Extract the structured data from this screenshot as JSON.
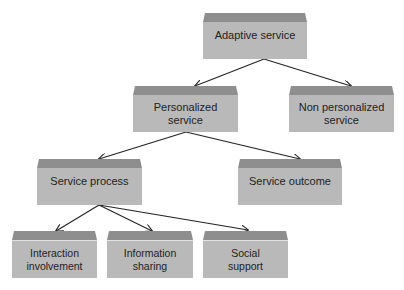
{
  "diagram": {
    "nodes": {
      "adaptive": {
        "label": "Adaptive service"
      },
      "personalized": {
        "label": "Personalized service"
      },
      "non_personalized": {
        "label": "Non personalized service"
      },
      "service_process": {
        "label": "Service process"
      },
      "service_outcome": {
        "label": "Service outcome"
      },
      "interaction": {
        "label": "Interaction involvement"
      },
      "information": {
        "label": "Information sharing"
      },
      "social": {
        "label": "Social support"
      }
    },
    "edges": [
      {
        "from": "Adaptive service",
        "to": "Personalized service"
      },
      {
        "from": "Adaptive service",
        "to": "Non personalized service"
      },
      {
        "from": "Personalized service",
        "to": "Service process"
      },
      {
        "from": "Personalized service",
        "to": "Service outcome"
      },
      {
        "from": "Service process",
        "to": "Interaction involvement"
      },
      {
        "from": "Service process",
        "to": "Information sharing"
      },
      {
        "from": "Service process",
        "to": "Social support"
      }
    ],
    "colors": {
      "bevel": "#8e8e8e",
      "face": "#b9b9b9",
      "arrow": "#222222",
      "text": "#222222"
    }
  }
}
